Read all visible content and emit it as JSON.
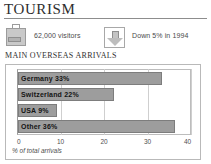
{
  "header": {
    "title": "TOURISM"
  },
  "stats": [
    {
      "icon": "suitcase-icon",
      "label": "62,000 visitors"
    },
    {
      "icon": "down-arrow-icon",
      "label": "Down 5% in 1994"
    }
  ],
  "chart_section": {
    "heading": "MAIN OVERSEAS ARRIVALS"
  },
  "chart_data": {
    "type": "bar",
    "orientation": "horizontal",
    "title": "MAIN OVERSEAS ARRIVALS",
    "categories": [
      "Germany",
      "Switzerland",
      "USA",
      "Other"
    ],
    "values": [
      33,
      22,
      9,
      36
    ],
    "bar_labels": [
      "Germany  33%",
      "Switzerland  22%",
      "USA  9%",
      "Other  36%"
    ],
    "xlabel": "% of total arrivals",
    "ylabel": "",
    "xlim": [
      0,
      40
    ],
    "xticks": [
      0,
      10,
      20,
      30,
      40
    ],
    "xtick_labels": [
      "0",
      "10",
      "20",
      "30",
      "40"
    ],
    "grid": true,
    "legend": false,
    "bar_color": "#9d9d9d",
    "bar_border_color": "#7d7d7d"
  },
  "colors": {
    "accent_gray": "#9d9d9d",
    "rule": "#8d8d8d",
    "panel_border": "#b9b9b9",
    "text": "#333333"
  }
}
